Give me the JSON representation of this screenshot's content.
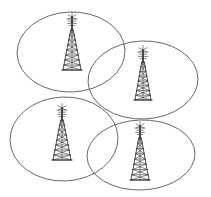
{
  "diagram": {
    "type": "schematic-illustration",
    "background_color": "#ffffff",
    "ellipse_stroke_color": "#5a5a5a",
    "tower_stroke_color": "#1c1c1c",
    "cells": [
      {
        "id": "cell-top-left",
        "label": "",
        "cx": 71,
        "cy": 52,
        "rx": 54,
        "ry": 40,
        "rotation": -2
      },
      {
        "id": "cell-top-right",
        "label": "",
        "cx": 143,
        "cy": 80,
        "rx": 55,
        "ry": 39,
        "rotation": -2
      },
      {
        "id": "cell-bottom-left",
        "label": "",
        "cx": 64,
        "cy": 139,
        "rx": 54,
        "ry": 42,
        "rotation": -2
      },
      {
        "id": "cell-bottom-right",
        "label": "",
        "cx": 141,
        "cy": 155,
        "rx": 54,
        "ry": 35,
        "rotation": -2
      }
    ],
    "towers": [
      {
        "id": "tower-top-left",
        "label": "",
        "base_x": 72,
        "base_y": 70,
        "height": 40,
        "half_base_width": 9,
        "mast_height": 13,
        "lattice_rows": 8
      },
      {
        "id": "tower-top-right",
        "label": "",
        "base_x": 143,
        "base_y": 100,
        "height": 38,
        "half_base_width": 8,
        "mast_height": 12,
        "lattice_rows": 8
      },
      {
        "id": "tower-bottom-left",
        "label": "",
        "base_x": 62,
        "base_y": 160,
        "height": 40,
        "half_base_width": 9,
        "mast_height": 12,
        "lattice_rows": 8
      },
      {
        "id": "tower-bottom-right",
        "label": "",
        "base_x": 140,
        "base_y": 180,
        "height": 42,
        "half_base_width": 9,
        "mast_height": 12,
        "lattice_rows": 8
      }
    ]
  }
}
